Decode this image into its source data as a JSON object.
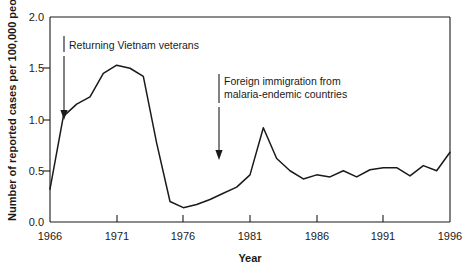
{
  "chart_data": {
    "type": "line",
    "title": "",
    "xlabel": "Year",
    "ylabel": "Number of reported cases per 100,000 people",
    "xlim": [
      1966,
      1996
    ],
    "ylim": [
      0.0,
      2.0
    ],
    "grid": false,
    "legend": null,
    "xticks": [
      1966,
      1971,
      1976,
      1981,
      1986,
      1991,
      1996
    ],
    "xtick_labels": [
      "1966",
      "1971",
      "1976",
      "1981",
      "1986",
      "1991",
      "1996"
    ],
    "yticks": [
      0.0,
      0.5,
      1.0,
      1.5,
      2.0
    ],
    "ytick_labels": [
      "0.0",
      "0.5",
      "1.0",
      "1.5",
      "2.0"
    ],
    "x": [
      1966,
      1967,
      1968,
      1969,
      1970,
      1971,
      1972,
      1973,
      1974,
      1975,
      1976,
      1977,
      1978,
      1979,
      1980,
      1981,
      1982,
      1983,
      1984,
      1985,
      1986,
      1987,
      1988,
      1989,
      1990,
      1991,
      1992,
      1993,
      1994,
      1995,
      1996
    ],
    "values": [
      0.32,
      1.03,
      1.15,
      1.22,
      1.45,
      1.53,
      1.5,
      1.42,
      0.77,
      0.2,
      0.14,
      0.17,
      0.22,
      0.28,
      0.34,
      0.46,
      0.92,
      0.62,
      0.5,
      0.42,
      0.46,
      0.44,
      0.5,
      0.44,
      0.51,
      0.53,
      0.53,
      0.45,
      0.55,
      0.5,
      0.68
    ],
    "annotations": [
      {
        "text": "Returning Vietnam veterans",
        "line1": "Returning Vietnam veterans",
        "line2": "",
        "arrow_x": 1967,
        "arrow_y_from": 1.88,
        "arrow_y_to": 1.12
      },
      {
        "text": "Foreign immigration from malaria-endemic countries",
        "line1": "Foreign immigration from",
        "line2": "malaria-endemic countries",
        "arrow_x": 1979,
        "arrow_y_from": 1.42,
        "arrow_y_to": 0.62
      }
    ],
    "colors": {
      "line": "#1a1a1a",
      "axis": "#1a1a1a",
      "background": "#ffffff",
      "text": "#1a1a1a"
    }
  }
}
